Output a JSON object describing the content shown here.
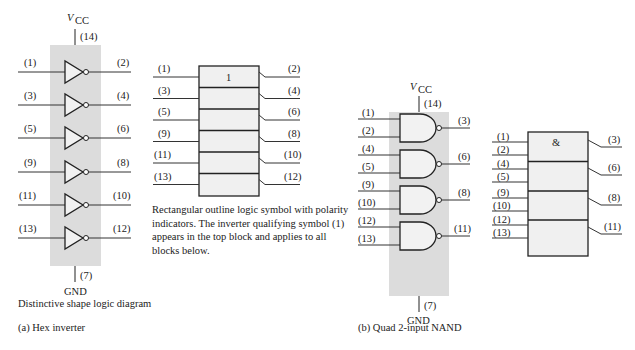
{
  "hex_inverter": {
    "vcc_label": "V",
    "vcc_sub": "CC",
    "vcc_pin": "(14)",
    "gnd_label": "GND",
    "gnd_pin": "(7)",
    "gates": [
      {
        "input": "(1)",
        "output": "(2)"
      },
      {
        "input": "(3)",
        "output": "(4)"
      },
      {
        "input": "(5)",
        "output": "(6)"
      },
      {
        "input": "(9)",
        "output": "(8)"
      },
      {
        "input": "(11)",
        "output": "(10)"
      },
      {
        "input": "(13)",
        "output": "(12)"
      }
    ],
    "distinctive_caption": "Distinctive shape logic diagram",
    "rect_qualifier": "1",
    "rect_note": "Rectangular outline logic symbol with polarity indicators.  The inverter qualifying symbol (1) appears in the top block and applies to all blocks below.",
    "figure_caption": "(a) Hex inverter"
  },
  "quad_nand": {
    "vcc_label": "V",
    "vcc_sub": "CC",
    "vcc_pin": "(14)",
    "gnd_label": "GND",
    "gnd_pin": "(7)",
    "gates": [
      {
        "inputs": [
          "(1)",
          "(2)"
        ],
        "output": "(3)"
      },
      {
        "inputs": [
          "(4)",
          "(5)"
        ],
        "output": "(6)"
      },
      {
        "inputs": [
          "(9)",
          "(10)"
        ],
        "output": "(8)"
      },
      {
        "inputs": [
          "(12)",
          "(13)"
        ],
        "output": "(11)"
      }
    ],
    "rect_qualifier": "&",
    "figure_caption": "(b) Quad 2-input NAND"
  },
  "colors": {
    "chip_fill": "#dcdcdc",
    "gate_fill": "#f2f2f2",
    "stroke": "#222222"
  }
}
